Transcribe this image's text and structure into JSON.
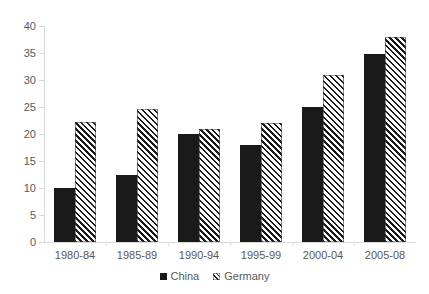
{
  "chart_data": {
    "type": "bar",
    "title": "",
    "subtitle": "",
    "xlabel": "",
    "ylabel": "",
    "categories": [
      "1980-84",
      "1985-89",
      "1990-94",
      "1995-99",
      "2000-04",
      "2005-08"
    ],
    "series": [
      {
        "name": "China",
        "values": [
          10.0,
          12.4,
          20.0,
          18.0,
          25.0,
          34.8
        ],
        "color": "#1a1a1a",
        "fill": "solid"
      },
      {
        "name": "Germany",
        "values": [
          22.3,
          24.7,
          21.0,
          22.0,
          31.0,
          38.0
        ],
        "color": "#1a1a1a",
        "fill": "diagonal-hatch"
      }
    ],
    "ylim": [
      0,
      40
    ],
    "ytick_step": 5,
    "yticks": [
      0,
      5,
      10,
      15,
      20,
      25,
      30,
      35,
      40
    ],
    "ytick_labels": [
      "0",
      "5",
      "10",
      "15",
      "20",
      "25",
      "30",
      "35",
      "40"
    ],
    "grid": false,
    "legend_position": "bottom-center",
    "legend": [
      {
        "label": "China",
        "marker": "solid-square-swatch"
      },
      {
        "label": "Germany",
        "marker": "hatched-square-swatch"
      }
    ]
  }
}
